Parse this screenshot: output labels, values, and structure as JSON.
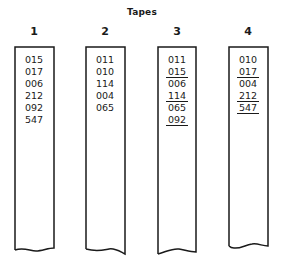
{
  "title": "Tapes",
  "tapes": [
    {
      "label": "1",
      "entries": [
        {
          "value": "015",
          "underlined": false
        },
        {
          "value": "017",
          "underlined": false
        },
        {
          "value": "006",
          "underlined": false
        },
        {
          "value": "212",
          "underlined": false
        },
        {
          "value": "092",
          "underlined": false
        },
        {
          "value": "547",
          "underlined": false
        }
      ]
    },
    {
      "label": "2",
      "entries": [
        {
          "value": "011",
          "underlined": false
        },
        {
          "value": "010",
          "underlined": false
        },
        {
          "value": "114",
          "underlined": false
        },
        {
          "value": "004",
          "underlined": false
        },
        {
          "value": "065",
          "underlined": false
        }
      ]
    },
    {
      "label": "3",
      "entries": [
        {
          "value": "011",
          "underlined": false
        },
        {
          "value": "015",
          "underlined": true
        },
        {
          "value": "006",
          "underlined": false
        },
        {
          "value": "114",
          "underlined": true
        },
        {
          "value": "065",
          "underlined": false
        },
        {
          "value": "092",
          "underlined": true
        }
      ]
    },
    {
      "label": "4",
      "entries": [
        {
          "value": "010",
          "underlined": false
        },
        {
          "value": "017",
          "underlined": true
        },
        {
          "value": "004",
          "underlined": false
        },
        {
          "value": "212",
          "underlined": true
        },
        {
          "value": "547",
          "underlined": true
        }
      ]
    }
  ],
  "colors": {
    "line": "#1a1a1a",
    "background": "#ffffff"
  }
}
